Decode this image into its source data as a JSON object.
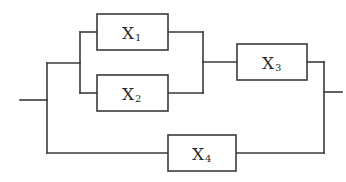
{
  "diagram": {
    "type": "reliability-block-diagram",
    "colors": {
      "line": "#3a3a3a",
      "background": "#ffffff"
    },
    "blocks": [
      {
        "id": "X1",
        "letter": "X",
        "subscript": "1"
      },
      {
        "id": "X2",
        "letter": "X",
        "subscript": "2"
      },
      {
        "id": "X3",
        "letter": "X",
        "subscript": "3"
      },
      {
        "id": "X4",
        "letter": "X",
        "subscript": "4"
      }
    ],
    "connections": [
      {
        "from": "input",
        "to": "X1"
      },
      {
        "from": "input",
        "to": "X2"
      },
      {
        "from": "X1",
        "to": "X3"
      },
      {
        "from": "X2",
        "to": "X3"
      },
      {
        "from": "X3",
        "to": "output"
      },
      {
        "from": "input",
        "to": "X4"
      },
      {
        "from": "X4",
        "to": "output"
      }
    ]
  }
}
